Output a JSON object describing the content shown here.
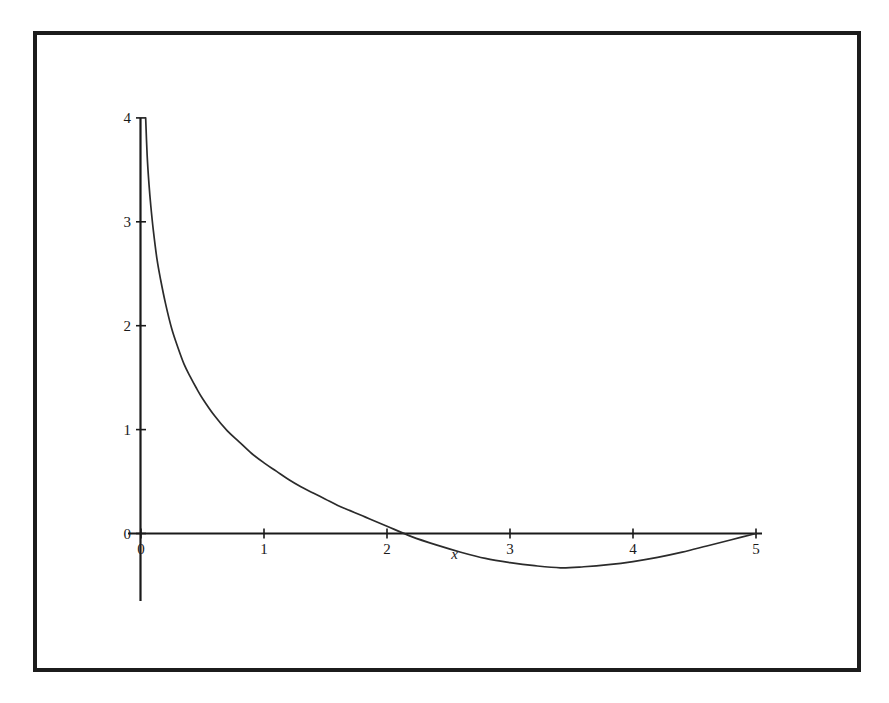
{
  "figure": {
    "background_color": "#ffffff",
    "frame_color": "#1c1c1c",
    "axis_color": "#1a1a1a",
    "curve_color": "#2b2b2b"
  },
  "chart_data": {
    "type": "line",
    "title": "",
    "subtitle": "",
    "xlabel": "x",
    "ylabel": "",
    "grid": false,
    "legend": false,
    "legend_position": "none",
    "xlim": [
      -0.05,
      5.15
    ],
    "ylim": [
      -0.65,
      4.1
    ],
    "xticks": [
      0,
      1,
      2,
      3,
      4,
      5
    ],
    "xticklabels": [
      "0",
      "1",
      "2",
      "3",
      "4",
      "5"
    ],
    "yticks": [
      0,
      1,
      2,
      3,
      4
    ],
    "yticklabels": [
      "0",
      "1",
      "2",
      "3",
      "4"
    ],
    "annotations": [
      {
        "text": "x",
        "x": 2.55,
        "y": -0.25
      }
    ],
    "series": [
      {
        "name": "curve",
        "description": "decreasing-then-increasing curve with vertical asymptote at x=0, roots near x=1.86 and x=5, minimum near x=3.41",
        "x": [
          0.038,
          0.05,
          0.065,
          0.08,
          0.1,
          0.13,
          0.16,
          0.2,
          0.25,
          0.3,
          0.35,
          0.4,
          0.45,
          0.5,
          0.6,
          0.7,
          0.8,
          0.9,
          1.0,
          1.1,
          1.2,
          1.3,
          1.4,
          1.5,
          1.6,
          1.7,
          1.8,
          1.86,
          2.0,
          2.2,
          2.4,
          2.6,
          2.8,
          3.0,
          3.2,
          3.41,
          3.6,
          3.8,
          4.0,
          4.2,
          4.4,
          4.6,
          4.8,
          5.0
        ],
        "y": [
          4.0,
          3.64,
          3.36,
          3.15,
          2.92,
          2.64,
          2.44,
          2.21,
          1.97,
          1.79,
          1.63,
          1.51,
          1.4,
          1.3,
          1.13,
          0.99,
          0.88,
          0.77,
          0.68,
          0.6,
          0.52,
          0.45,
          0.39,
          0.33,
          0.27,
          0.22,
          0.17,
          0.14,
          0.07,
          -0.03,
          -0.11,
          -0.18,
          -0.24,
          -0.28,
          -0.31,
          -0.33,
          -0.32,
          -0.3,
          -0.27,
          -0.23,
          -0.18,
          -0.12,
          -0.06,
          0.0
        ]
      }
    ]
  }
}
